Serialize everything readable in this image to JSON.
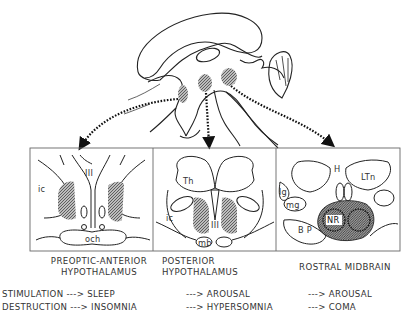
{
  "figure": {
    "panels": [
      {
        "id": "preoptic",
        "title_line1": "PREOPTIC-ANTERIOR",
        "title_line2": "HYPOTHALAMUS",
        "labels": {
          "ventricle": "III",
          "capsule": "ic",
          "chiasm": "och"
        },
        "stimulation": "SLEEP",
        "destruction": "INSOMNIA"
      },
      {
        "id": "posterior",
        "title_line1": "POSTERIOR",
        "title_line2": "HYPOTHALAMUS",
        "labels": {
          "thalamus": "Th",
          "capsule": "ic",
          "ventricle": "III",
          "mammillary": "mb"
        },
        "stimulation": "AROUSAL",
        "destruction": "HYPERSOMNIA"
      },
      {
        "id": "midbrain",
        "title_line1": "ROSTRAL MIDBRAIN",
        "title_line2": "",
        "labels": {
          "habenula": "H",
          "lateral_thalamus": "LTn",
          "lateral_geniculate": "lg",
          "medial_geniculate": "mg",
          "red_nucleus": "NR",
          "basis_pedunculi": "B P"
        },
        "stimulation": "AROUSAL",
        "destruction": "COMA"
      }
    ],
    "rows": {
      "stimulation_label": "STIMULATION",
      "destruction_label": "DESTRUCTION",
      "arrow": "--->"
    },
    "colors": {
      "line": "#222222",
      "hatch": "#8a8a8a",
      "box": "#555555"
    }
  }
}
